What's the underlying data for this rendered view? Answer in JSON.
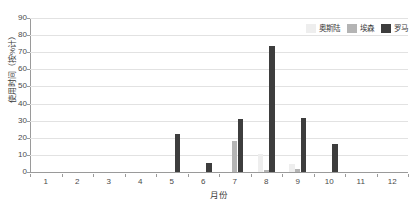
{
  "chart_data": {
    "type": "bar",
    "title": "",
    "subtitle": "",
    "xlabel": "月份",
    "ylabel": "使用时间（按%计）",
    "categories": [
      "1",
      "2",
      "3",
      "4",
      "5",
      "6",
      "7",
      "8",
      "9",
      "10",
      "11",
      "12"
    ],
    "ylim": [
      0,
      90
    ],
    "ytick_labels": [
      "0",
      "10",
      "20",
      "30",
      "40",
      "50",
      "60",
      "70",
      "80",
      "90"
    ],
    "ytick_values": [
      0,
      10,
      20,
      30,
      40,
      50,
      60,
      70,
      80,
      90
    ],
    "grid": true,
    "grid_axis": "y",
    "legend_position": "top-right",
    "series": [
      {
        "name": "奥斯陆",
        "color": "#eeeeee",
        "values": [
          0,
          0,
          0,
          0,
          0,
          0,
          0,
          10.5,
          4.5,
          0,
          0,
          0
        ]
      },
      {
        "name": "埃森",
        "color": "#b4b4b4",
        "values": [
          0,
          0,
          0,
          0,
          0,
          0,
          18,
          1,
          1.7,
          0,
          0,
          0
        ]
      },
      {
        "name": "罗马",
        "color": "#3d3d3d",
        "values": [
          0,
          0,
          0,
          0,
          22,
          5.5,
          31,
          73.5,
          31.5,
          16.5,
          0,
          0
        ]
      }
    ]
  },
  "colors": {
    "background": "#ffffff",
    "grid": "#e2e2e2",
    "axis": "#9a9a9a",
    "text": "#3a3a3a",
    "series_oslo": "#eeeeee",
    "series_essen": "#b4b4b4",
    "series_rome": "#3d3d3d"
  }
}
